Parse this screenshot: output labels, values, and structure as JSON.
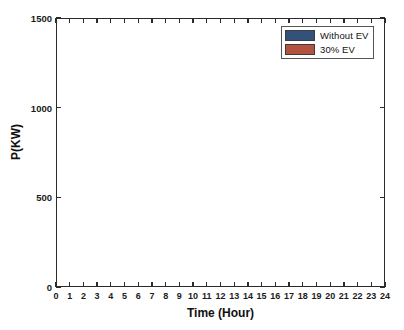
{
  "chart_data": {
    "type": "area",
    "title": "",
    "xlabel": "Time (Hour)",
    "ylabel": "P(KW)",
    "xlim": [
      0,
      24
    ],
    "ylim": [
      0,
      1500
    ],
    "xticks": [
      0,
      1,
      2,
      3,
      4,
      5,
      6,
      7,
      8,
      9,
      10,
      11,
      12,
      13,
      14,
      15,
      16,
      17,
      18,
      19,
      20,
      21,
      22,
      23,
      24
    ],
    "xtick_labels": [
      "0",
      "1",
      "2",
      "3",
      "4",
      "5",
      "6",
      "7",
      "8",
      "9",
      "10",
      "11",
      "12",
      "13",
      "14",
      "15",
      "16",
      "17",
      "18",
      "19",
      "20",
      "21",
      "22",
      "23",
      "24"
    ],
    "yticks": [
      0,
      500,
      1000,
      1500
    ],
    "ytick_labels": [
      "0",
      "500",
      "1000",
      "1500"
    ],
    "grid": false,
    "stacked": false,
    "legend_position": "top-right",
    "x": [
      0,
      1,
      2,
      3,
      4,
      5,
      6,
      7,
      8,
      9,
      10,
      11,
      12,
      13,
      14,
      15,
      16,
      17,
      18,
      19,
      20,
      21,
      22,
      23,
      24
    ],
    "series": [
      {
        "name": "30% EV",
        "color": "#b3523f",
        "values": [
          495,
          450,
          448,
          415,
          385,
          425,
          468,
          520,
          560,
          600,
          660,
          650,
          700,
          755,
          830,
          800,
          1010,
          1080,
          1215,
          1090,
          1105,
          1050,
          930,
          780,
          650
        ]
      },
      {
        "name": "Without EV",
        "color": "#33517a",
        "values": [
          495,
          450,
          448,
          415,
          385,
          425,
          468,
          520,
          560,
          600,
          655,
          595,
          635,
          635,
          640,
          570,
          640,
          760,
          895,
          940,
          960,
          900,
          830,
          740,
          650
        ]
      }
    ],
    "legend": [
      {
        "label": "Without EV",
        "color": "#33517a"
      },
      {
        "label": "30% EV",
        "color": "#b3523f"
      }
    ]
  },
  "axes": {
    "x_title": "Time (Hour)",
    "y_title": "P(KW)"
  }
}
